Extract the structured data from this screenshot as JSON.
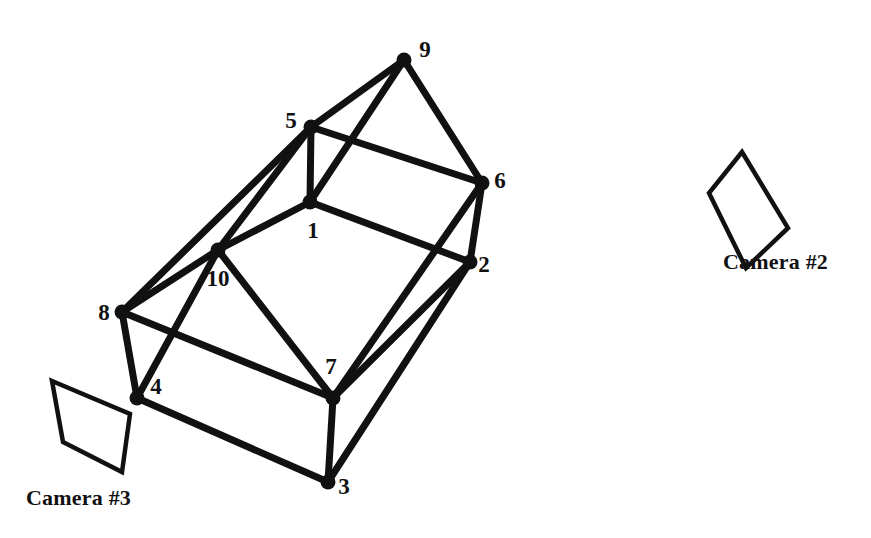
{
  "figure": {
    "background_color": "#ffffff",
    "ink_color": "#111111",
    "width": 871,
    "height": 538
  },
  "vertices": [
    {
      "id": "1",
      "label": "1",
      "x": 310,
      "y": 202,
      "label_x": 313,
      "label_y": 238
    },
    {
      "id": "2",
      "label": "2",
      "x": 470,
      "y": 262,
      "label_x": 484,
      "label_y": 272
    },
    {
      "id": "3",
      "label": "3",
      "x": 328,
      "y": 482,
      "label_x": 344,
      "label_y": 494
    },
    {
      "id": "4",
      "label": "4",
      "x": 137,
      "y": 398,
      "label_x": 156,
      "label_y": 394
    },
    {
      "id": "5",
      "label": "5",
      "x": 311,
      "y": 127,
      "label_x": 291,
      "label_y": 128
    },
    {
      "id": "6",
      "label": "6",
      "x": 482,
      "y": 183,
      "label_x": 500,
      "label_y": 188
    },
    {
      "id": "7",
      "label": "7",
      "x": 333,
      "y": 398,
      "label_x": 331,
      "label_y": 374
    },
    {
      "id": "8",
      "label": "8",
      "x": 122,
      "y": 312,
      "label_x": 104,
      "label_y": 320
    },
    {
      "id": "9",
      "label": "9",
      "x": 404,
      "y": 60,
      "label_x": 425,
      "label_y": 57
    },
    {
      "id": "10",
      "label": "10",
      "x": 218,
      "y": 250,
      "label_x": 218,
      "label_y": 286
    }
  ],
  "edges": [
    {
      "from": "9",
      "to": "5"
    },
    {
      "from": "9",
      "to": "6"
    },
    {
      "from": "9",
      "to": "1"
    },
    {
      "from": "5",
      "to": "6"
    },
    {
      "from": "5",
      "to": "1"
    },
    {
      "from": "5",
      "to": "8"
    },
    {
      "from": "5",
      "to": "10"
    },
    {
      "from": "6",
      "to": "2"
    },
    {
      "from": "6",
      "to": "7"
    },
    {
      "from": "1",
      "to": "2"
    },
    {
      "from": "1",
      "to": "10"
    },
    {
      "from": "2",
      "to": "3"
    },
    {
      "from": "2",
      "to": "7"
    },
    {
      "from": "10",
      "to": "8"
    },
    {
      "from": "10",
      "to": "7"
    },
    {
      "from": "10",
      "to": "4"
    },
    {
      "from": "8",
      "to": "4"
    },
    {
      "from": "8",
      "to": "7"
    },
    {
      "from": "4",
      "to": "3"
    },
    {
      "from": "7",
      "to": "3"
    }
  ],
  "vertex_dot_radius": 7.5,
  "cameras": [
    {
      "id": "camera2",
      "caption": "Camera #2",
      "frame_points": "742,152 788,228 746,268 709,193"
    },
    {
      "id": "camera3",
      "caption": "Camera #3",
      "frame_points": "52,381 130,414 122,472 63,442"
    }
  ]
}
